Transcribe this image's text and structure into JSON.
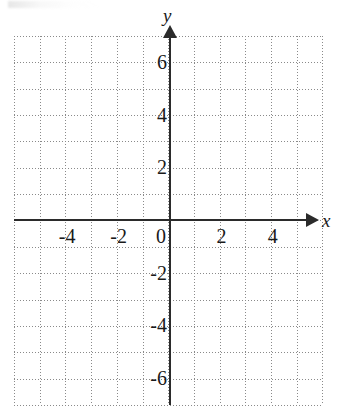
{
  "figure": {
    "type": "coordinate-grid",
    "title": "",
    "background_color": "#ffffff",
    "axis_color": "#2b2b2b",
    "grid_color": "#8a8a8a",
    "label_color": "#1a1a1a"
  },
  "axes": {
    "x": {
      "name": "x",
      "arrow": "right",
      "tick_labels": [
        "-4",
        "-2",
        "0",
        "2",
        "4"
      ],
      "tick_values": [
        -4,
        -2,
        0,
        2,
        4
      ],
      "range": [
        -6,
        6
      ]
    },
    "y": {
      "name": "y",
      "arrow": "up",
      "tick_labels": [
        "6",
        "4",
        "2",
        "-2",
        "-4",
        "-6"
      ],
      "tick_values": [
        6,
        4,
        2,
        -2,
        -4,
        -6
      ],
      "range": [
        -7,
        7
      ]
    }
  },
  "chart_data": {
    "type": "scatter",
    "title": "",
    "xlabel": "x",
    "ylabel": "y",
    "x": [],
    "y": [],
    "series": [],
    "xlim": [
      -6,
      6
    ],
    "ylim": [
      -7,
      7
    ],
    "xticks": [
      -4,
      -2,
      0,
      2,
      4
    ],
    "yticks": [
      6,
      4,
      2,
      -2,
      -4,
      -6
    ],
    "xticklabels": [
      "-4",
      "-2",
      "0",
      "2",
      "4"
    ],
    "yticklabels": [
      "6",
      "4",
      "2",
      "-2",
      "-4",
      "-6"
    ],
    "grid": true,
    "grid_style": "dotted",
    "grid_step": 1,
    "legend": null,
    "annotations": [],
    "note": "Empty blank Cartesian graphing grid with no plotted data."
  },
  "grid": {
    "vertical_count": 13,
    "horizontal_count": 15,
    "origin_x": 170,
    "origin_y": 220,
    "cell_width": 25.7,
    "cell_height": 26.35
  }
}
